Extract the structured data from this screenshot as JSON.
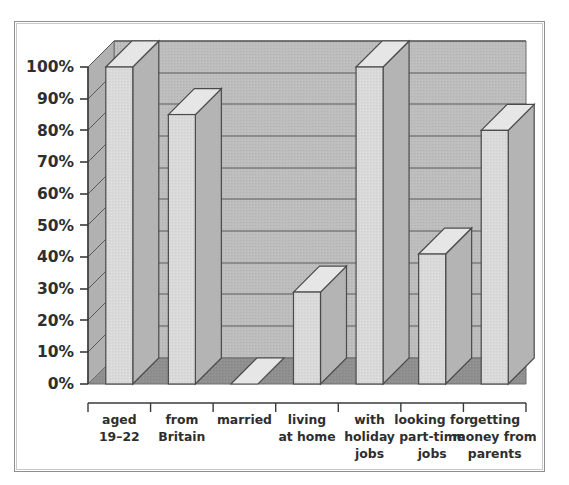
{
  "chart_data": {
    "type": "bar",
    "title": "",
    "subtitle": "",
    "xlabel": "",
    "ylabel": "",
    "categories": [
      "aged 19–22",
      "from Britain",
      "married",
      "living at home",
      "with holiday jobs",
      "looking for part-time jobs",
      "getting money from parents"
    ],
    "category_lines": [
      [
        "aged",
        "19–22"
      ],
      [
        "from",
        "Britain"
      ],
      [
        "married"
      ],
      [
        "living",
        "at home"
      ],
      [
        "with",
        "holiday",
        "jobs"
      ],
      [
        "looking for",
        "part-time",
        "jobs"
      ],
      [
        "getting",
        "money from",
        "parents"
      ]
    ],
    "values": [
      100,
      85,
      0,
      29,
      100,
      41,
      80
    ],
    "value_labels": [
      "100%",
      "85%",
      "0%",
      "29%",
      "100%",
      "41%",
      "80%"
    ],
    "ylim": [
      0,
      100
    ],
    "ytick_values": [
      0,
      10,
      20,
      30,
      40,
      50,
      60,
      70,
      80,
      90,
      100
    ],
    "ytick_labels": [
      "0%",
      "10%",
      "20%",
      "30%",
      "40%",
      "50%",
      "60%",
      "70%",
      "80%",
      "90%",
      "100%"
    ],
    "grid": true,
    "grid_axis": "y",
    "legend": false,
    "legend_position": "none",
    "three_d": true,
    "annotations": []
  },
  "style": {
    "page_background": "#ffffff",
    "frame_border": "#8e8e8e",
    "frame_border_inner": "#c9c9c9",
    "wall_back": "#b8b8b8",
    "wall_side": "#bdbdbd",
    "floor": "#8d8d8d",
    "bar_front": "#d8d8d8",
    "bar_top": "#e6e6e6",
    "bar_side": "#b4b4b4",
    "bar_outline": "#4b4b4b",
    "gridline": "#555555",
    "axis_line": "#3a3a3a",
    "tick_label": "#2e2e2e"
  }
}
